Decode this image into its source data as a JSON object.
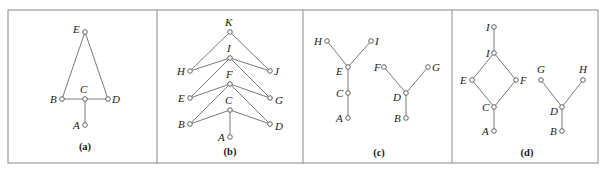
{
  "figure": {
    "frame": {
      "x": 8,
      "y": 10,
      "width": 590,
      "height": 153
    },
    "dividers": [
      157,
      303,
      452
    ],
    "colors": {
      "edge": "#7a7a7a",
      "node_stroke": "#555555",
      "frame": "#8a8a8a",
      "text": "#1a1a1a"
    },
    "panels": [
      {
        "id": "a",
        "caption": "(a)",
        "caption_pos": [
          85,
          150
        ],
        "nodes": [
          {
            "id": "E",
            "label": "E",
            "x": 85,
            "y": 32,
            "lx": 73,
            "ly": 33
          },
          {
            "id": "B",
            "label": "B",
            "x": 62,
            "y": 99,
            "lx": 50,
            "ly": 103
          },
          {
            "id": "C",
            "label": "C",
            "x": 85,
            "y": 99,
            "lx": 80,
            "ly": 93
          },
          {
            "id": "D",
            "label": "D",
            "x": 108,
            "y": 99,
            "lx": 112,
            "ly": 103
          },
          {
            "id": "A",
            "label": "A",
            "x": 85,
            "y": 125,
            "lx": 73,
            "ly": 129
          }
        ],
        "edges": [
          [
            "E",
            "B"
          ],
          [
            "E",
            "D"
          ],
          [
            "B",
            "C"
          ],
          [
            "C",
            "D"
          ],
          [
            "C",
            "A"
          ]
        ]
      },
      {
        "id": "b",
        "caption": "(b)",
        "caption_pos": [
          230,
          155
        ],
        "nodes": [
          {
            "id": "K",
            "label": "K",
            "x": 230,
            "y": 32,
            "lx": 225,
            "ly": 26
          },
          {
            "id": "I",
            "label": "I",
            "x": 230,
            "y": 58,
            "lx": 227,
            "ly": 52
          },
          {
            "id": "H",
            "label": "H",
            "x": 190,
            "y": 71,
            "lx": 177,
            "ly": 75
          },
          {
            "id": "J",
            "label": "J",
            "x": 270,
            "y": 71,
            "lx": 274,
            "ly": 75
          },
          {
            "id": "F",
            "label": "F",
            "x": 230,
            "y": 84,
            "lx": 226,
            "ly": 78
          },
          {
            "id": "E",
            "label": "E",
            "x": 190,
            "y": 98,
            "lx": 178,
            "ly": 102
          },
          {
            "id": "G",
            "label": "G",
            "x": 270,
            "y": 98,
            "lx": 275,
            "ly": 104
          },
          {
            "id": "C",
            "label": "C",
            "x": 230,
            "y": 110,
            "lx": 225,
            "ly": 104
          },
          {
            "id": "B",
            "label": "B",
            "x": 190,
            "y": 124,
            "lx": 178,
            "ly": 128
          },
          {
            "id": "D",
            "label": "D",
            "x": 270,
            "y": 124,
            "lx": 275,
            "ly": 130
          },
          {
            "id": "A",
            "label": "A",
            "x": 230,
            "y": 137,
            "lx": 218,
            "ly": 141
          }
        ],
        "edges": [
          [
            "K",
            "H"
          ],
          [
            "K",
            "J"
          ],
          [
            "I",
            "H"
          ],
          [
            "I",
            "J"
          ],
          [
            "I",
            "E"
          ],
          [
            "I",
            "G"
          ],
          [
            "F",
            "E"
          ],
          [
            "F",
            "G"
          ],
          [
            "F",
            "B"
          ],
          [
            "F",
            "D"
          ],
          [
            "C",
            "B"
          ],
          [
            "C",
            "D"
          ],
          [
            "C",
            "A"
          ]
        ]
      },
      {
        "id": "c",
        "caption": "(c)",
        "caption_pos": [
          379,
          156
        ],
        "nodes": [
          {
            "id": "H",
            "label": "H",
            "x": 327,
            "y": 41,
            "lx": 314,
            "ly": 45
          },
          {
            "id": "I",
            "label": "I",
            "x": 371,
            "y": 41,
            "lx": 375,
            "ly": 45
          },
          {
            "id": "E",
            "label": "E",
            "x": 348,
            "y": 67,
            "lx": 336,
            "ly": 75
          },
          {
            "id": "C",
            "label": "C",
            "x": 348,
            "y": 93,
            "lx": 336,
            "ly": 97
          },
          {
            "id": "A",
            "label": "A",
            "x": 348,
            "y": 118,
            "lx": 336,
            "ly": 122
          },
          {
            "id": "F",
            "label": "F",
            "x": 384,
            "y": 67,
            "lx": 374,
            "ly": 71
          },
          {
            "id": "G",
            "label": "G",
            "x": 428,
            "y": 67,
            "lx": 432,
            "ly": 71
          },
          {
            "id": "D",
            "label": "D",
            "x": 406,
            "y": 93,
            "lx": 393,
            "ly": 101
          },
          {
            "id": "B",
            "label": "B",
            "x": 406,
            "y": 118,
            "lx": 394,
            "ly": 122
          }
        ],
        "edges": [
          [
            "H",
            "E"
          ],
          [
            "I",
            "E"
          ],
          [
            "E",
            "C"
          ],
          [
            "C",
            "A"
          ],
          [
            "F",
            "D"
          ],
          [
            "G",
            "D"
          ],
          [
            "D",
            "B"
          ]
        ]
      },
      {
        "id": "d",
        "caption": "(d)",
        "caption_pos": [
          527,
          156
        ],
        "nodes": [
          {
            "id": "T",
            "label": "I",
            "x": 494,
            "y": 27,
            "lx": 486,
            "ly": 31
          },
          {
            "id": "I",
            "label": "I",
            "x": 494,
            "y": 53,
            "lx": 486,
            "ly": 57
          },
          {
            "id": "E",
            "label": "E",
            "x": 472,
            "y": 80,
            "lx": 460,
            "ly": 84
          },
          {
            "id": "F",
            "label": "F",
            "x": 516,
            "y": 80,
            "lx": 520,
            "ly": 84
          },
          {
            "id": "C",
            "label": "C",
            "x": 494,
            "y": 107,
            "lx": 482,
            "ly": 111
          },
          {
            "id": "A",
            "label": "A",
            "x": 494,
            "y": 131,
            "lx": 482,
            "ly": 135
          },
          {
            "id": "G",
            "label": "G",
            "x": 541,
            "y": 80,
            "lx": 537,
            "ly": 73
          },
          {
            "id": "H",
            "label": "H",
            "x": 583,
            "y": 80,
            "lx": 579,
            "ly": 73
          },
          {
            "id": "D",
            "label": "D",
            "x": 562,
            "y": 107,
            "lx": 550,
            "ly": 115
          },
          {
            "id": "B",
            "label": "B",
            "x": 562,
            "y": 131,
            "lx": 550,
            "ly": 135
          }
        ],
        "edges": [
          [
            "T",
            "I"
          ],
          [
            "I",
            "E"
          ],
          [
            "I",
            "F"
          ],
          [
            "E",
            "C"
          ],
          [
            "F",
            "C"
          ],
          [
            "C",
            "A"
          ],
          [
            "G",
            "D"
          ],
          [
            "H",
            "D"
          ],
          [
            "D",
            "B"
          ]
        ]
      }
    ]
  }
}
